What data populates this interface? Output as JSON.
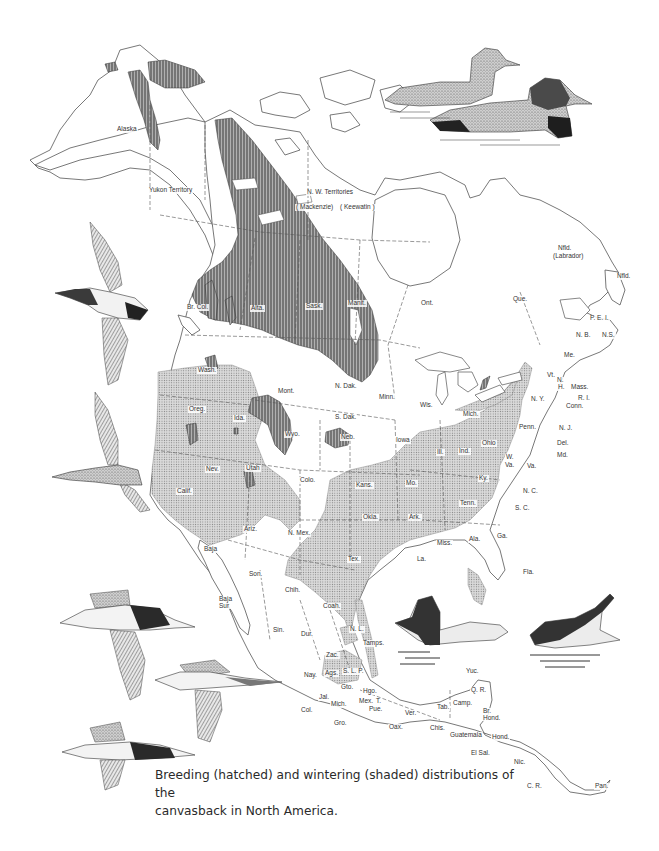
{
  "map": {
    "title": "Canvasback distribution map",
    "caption": {
      "line1": "Breeding (hatched) and wintering (shaded) distributions of the",
      "line2": "canvasback in North America."
    },
    "legend_semantics": {
      "breeding": "hatched",
      "wintering": "shaded"
    },
    "colors": {
      "outline": "#555555",
      "breeding_fill": "#8a8a8a",
      "wintering_fill": "#c4c4c4",
      "background": "#ffffff"
    },
    "labels": {
      "alaska": "Alaska",
      "yukon": "Yukon Territory",
      "nwt": "N. W. Territories",
      "mackenzie": "( Mackenzie)",
      "keewatin": "( Keewatin )",
      "br_col": "Br. Col.",
      "alta": "Alta.",
      "sask": "Sask.",
      "manit": "Manit.",
      "ont": "Ont.",
      "que": "Que.",
      "nfld_lab": "Nfld.",
      "labrador": "(Labrador)",
      "nfld": "Nfld.",
      "pei": "P. E. I.",
      "nb": "N. B.",
      "ns": "N.S.",
      "me": "Me.",
      "vt": "Vt.",
      "nh_n": "N.",
      "nh_h": "H.",
      "mass": "Mass.",
      "ri": "R. I.",
      "conn": "Conn.",
      "ny": "N. Y.",
      "nj": "N. J.",
      "penn": "Penn.",
      "del": "Del.",
      "md": "Md.",
      "wva_w": "W.",
      "wva_va": "Va.",
      "va": "Va.",
      "nc": "N. C.",
      "sc": "S. C.",
      "ga": "Ga.",
      "fla": "Fla.",
      "ala": "Ala.",
      "miss": "Miss.",
      "tenn": "Tenn.",
      "ky": "Ky.",
      "ohio": "Ohio",
      "ind": "Ind.",
      "ill": "Ill.",
      "mich": "Mich.",
      "wis": "Wis.",
      "minn": "Minn.",
      "iowa": "Iowa",
      "mo": "Mo.",
      "ark": "Ark.",
      "la": "La.",
      "tex": "Tex.",
      "okla": "Okla.",
      "kans": "Kans.",
      "neb": "Neb.",
      "sdak": "S. Dak.",
      "ndak": "N. Dak.",
      "mont": "Mont.",
      "wyo": "Wyo.",
      "colo": "Colo.",
      "nmex": "N. Mex.",
      "ariz": "Ariz.",
      "utah": "Utah",
      "nev": "Nev.",
      "calif": "Calif.",
      "oreg": "Oreg.",
      "wash": "Wash.",
      "ida": "Ida.",
      "baja": "Baja",
      "baja_sur": "Baja Sur",
      "son": "Son.",
      "chih": "Chih.",
      "coah": "Coah.",
      "nl": "N. L.",
      "tamps": "Tamps.",
      "sin": "Sin.",
      "dur": "Dur.",
      "zac": "Zac.",
      "slp": "S. L. P.",
      "nay": "Nay.",
      "ags": "Ags.",
      "gto": "Gto.",
      "hgo": "Hgo.",
      "jal": "Jal.",
      "mich_mx": "Mich.",
      "mex": "Mex.",
      "tlax": "T.",
      "pue": "Pue.",
      "col": "Col.",
      "gro": "Gro.",
      "oax": "Oax.",
      "ver": "Ver.",
      "tab": "Tab.",
      "camp": "Camp.",
      "yuc": "Yuc.",
      "qr": "Q. R.",
      "chis": "Chis.",
      "guatemala": "Guatemala",
      "br_hond": "Br. Hond.",
      "hond": "Hond.",
      "el_sal": "El Sal.",
      "nic": "Nic.",
      "cr": "C. R.",
      "pan": "Pan."
    }
  },
  "illustrations": [
    {
      "name": "pair-swimming-top-right",
      "description": "female and male canvasback swimming"
    },
    {
      "name": "flying-duck-left-1",
      "description": "canvasback in flight, wings up"
    },
    {
      "name": "flying-duck-left-2",
      "description": "canvasback in flight, banking"
    },
    {
      "name": "flying-flock-bottom-left",
      "description": "three canvasbacks in flight"
    },
    {
      "name": "pair-swimming-bottom-right",
      "description": "male canvasback swimming and one diving"
    }
  ]
}
